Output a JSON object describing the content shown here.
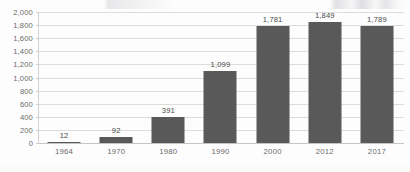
{
  "chart_data": {
    "type": "bar",
    "title": "",
    "subtitle": "",
    "xlabel": "",
    "ylabel": "",
    "categories": [
      "1964",
      "1970",
      "1980",
      "1990",
      "2000",
      "2012",
      "2017"
    ],
    "values": [
      12,
      92,
      391,
      1099,
      1781,
      1849,
      1789
    ],
    "value_labels": [
      "12",
      "92",
      "391",
      "1,099",
      "1,781",
      "1,849",
      "1,789"
    ],
    "ylim": [
      0,
      2000
    ],
    "ytick_step": 200,
    "ytick_labels": [
      "2,000",
      "1,800",
      "1,600",
      "1,400",
      "1,200",
      "1,000",
      "800",
      "600",
      "400",
      "200",
      "0"
    ],
    "ytick_values": [
      2000,
      1800,
      1600,
      1400,
      1200,
      1000,
      800,
      600,
      400,
      200,
      0
    ],
    "grid": true,
    "grid_axis": "y",
    "legend": false,
    "legend_position": "none",
    "data_labels": true,
    "series": [
      {
        "name": "",
        "values": [
          12,
          92,
          391,
          1099,
          1781,
          1849,
          1789
        ]
      }
    ]
  },
  "colors": {
    "bar": "#595959",
    "gridline": "#dcdcdc",
    "axis_line": "#c4c4c4",
    "tick_text": "#6b6b6b",
    "label_text": "#4a4a4a",
    "background": "#fdfdfd"
  }
}
